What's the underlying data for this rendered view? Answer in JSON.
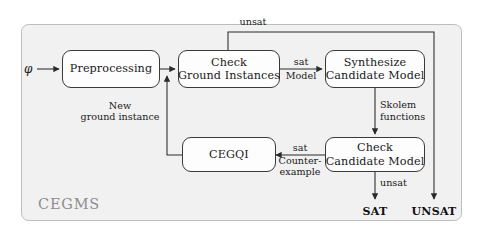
{
  "diagram": {
    "title_watermark": "CEGMS",
    "input_symbol": "φ",
    "container": {
      "label": "CEGMS"
    },
    "nodes": [
      {
        "id": "preprocessing",
        "lines": [
          "Preprocessing"
        ]
      },
      {
        "id": "check-ground",
        "lines": [
          "Check",
          "Ground Instances"
        ]
      },
      {
        "id": "synthesize-candidate",
        "lines": [
          "Synthesize",
          "Candidate Model"
        ]
      },
      {
        "id": "cegqi",
        "lines": [
          "CEGQI"
        ]
      },
      {
        "id": "check-candidate",
        "lines": [
          "Check",
          "Candidate Model"
        ]
      }
    ],
    "edge_labels": {
      "unsat_top": "unsat",
      "new_ground_instance_l1": "New",
      "new_ground_instance_l2": "ground instance",
      "sat_model_l1": "sat",
      "sat_model_l2": "Model",
      "skolem_l1": "Skolem",
      "skolem_l2": "functions",
      "sat_counterexample_l1": "sat",
      "sat_counterexample_l2": "Counter-",
      "sat_counterexample_l3": "example",
      "unsat_bottom": "unsat"
    },
    "terminals": [
      {
        "id": "sat-terminal",
        "label": "SAT"
      },
      {
        "id": "unsat-terminal",
        "label": "UNSAT"
      }
    ],
    "colors": {
      "stroke": "#3a3a3a",
      "node_fill": "#fdfdfd",
      "container_fill": "#f1f1f1",
      "text": "#1a1a1a",
      "watermark": "#8d8d8d"
    }
  }
}
